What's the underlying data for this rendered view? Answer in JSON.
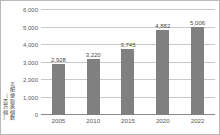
{
  "chart_data": {
    "type": "bar",
    "title": "",
    "subtitle": "",
    "xlabel": "",
    "ylabel": "宅配便取扱個数",
    "yunit": "（百万個）",
    "categories": [
      "2005",
      "2010",
      "2015",
      "2020",
      "2022"
    ],
    "values": [
      2928,
      3220,
      3745,
      4882,
      5006
    ],
    "value_labels": [
      "2,928",
      "3,220",
      "3,745",
      "4,882",
      "5,006"
    ],
    "ylim": [
      0,
      6000
    ],
    "ytick_values": [
      0,
      1000,
      2000,
      3000,
      4000,
      5000,
      6000
    ],
    "ytick_labels": [
      "0",
      "1,000",
      "2,000",
      "3,000",
      "4,000",
      "5,000",
      "6,000"
    ],
    "grid": true,
    "grid_axis": "y",
    "legend": false,
    "legend_position": "none",
    "series": [
      {
        "name": "宅配便取扱個数",
        "values": [
          2928,
          3220,
          3745,
          4882,
          5006
        ],
        "color": "#808080"
      }
    ],
    "colors": {
      "bar": "#808080",
      "grid": "#c9c9c9",
      "axis": "#8a8a8a",
      "text": "#5a5a5a",
      "border": "#b9b9b9",
      "background": "#ffffff"
    }
  }
}
